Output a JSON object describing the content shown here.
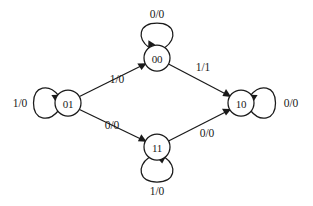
{
  "diagram": {
    "type": "mealy-state-machine",
    "title": "",
    "states": [
      {
        "id": "s00",
        "label": "00",
        "cx": 157,
        "cy": 58,
        "r": 13
      },
      {
        "id": "s01",
        "label": "01",
        "cx": 68,
        "cy": 103,
        "r": 13
      },
      {
        "id": "s10",
        "label": "10",
        "cx": 241,
        "cy": 103,
        "r": 13
      },
      {
        "id": "s11",
        "label": "11",
        "cx": 157,
        "cy": 147,
        "r": 13
      }
    ],
    "transitions": [
      {
        "id": "t-01-00",
        "from": "01",
        "to": "00",
        "label": "1/0",
        "label_x": 117,
        "label_y": 79
      },
      {
        "id": "t-00-10",
        "from": "00",
        "to": "10",
        "label": "1/1",
        "label_x": 203,
        "label_y": 67
      },
      {
        "id": "t-01-11",
        "from": "01",
        "to": "11",
        "label": "0/0",
        "label_x": 112,
        "label_y": 125
      },
      {
        "id": "t-11-10",
        "from": "11",
        "to": "10",
        "label": "0/0",
        "label_x": 207,
        "label_y": 133
      }
    ],
    "self_loops": [
      {
        "id": "loop-00",
        "state": "00",
        "label": "0/0",
        "position": "top",
        "label_x": 157,
        "label_y": 14
      },
      {
        "id": "loop-01",
        "state": "01",
        "label": "1/0",
        "position": "left",
        "label_x": 20,
        "label_y": 103
      },
      {
        "id": "loop-10",
        "state": "10",
        "label": "0/0",
        "position": "right",
        "label_x": 291,
        "label_y": 103
      },
      {
        "id": "loop-11",
        "state": "11",
        "label": "1/0",
        "position": "bottom",
        "label_x": 157,
        "label_y": 191
      }
    ],
    "colors": {
      "stroke": "#1a1a1a",
      "fill": "#ffffff",
      "background": "#ffffff"
    }
  }
}
